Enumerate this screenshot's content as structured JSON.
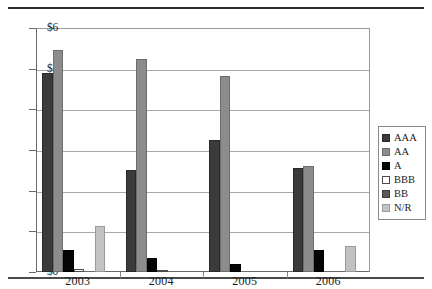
{
  "chart_data": {
    "type": "bar",
    "title": "",
    "xlabel": "",
    "ylabel": "",
    "categories": [
      "2003",
      "2004",
      "2005",
      "2006"
    ],
    "ylim": [
      0,
      6
    ],
    "ytick_labels": [
      "$0",
      "$1",
      "$2",
      "$3",
      "$4",
      "$5",
      "$6"
    ],
    "ytick_values": [
      0,
      1,
      2,
      3,
      4,
      5,
      6
    ],
    "grid": true,
    "legend_position": "right",
    "series": [
      {
        "name": "AAA",
        "color": "#3b3b3b",
        "values": [
          4.9,
          2.5,
          3.25,
          2.55
        ]
      },
      {
        "name": "AA",
        "color": "#8c8c8c",
        "values": [
          5.45,
          5.25,
          4.83,
          2.6
        ]
      },
      {
        "name": "A",
        "color": "#050505",
        "values": [
          0.55,
          0.35,
          0.2,
          0.53
        ]
      },
      {
        "name": "BBB",
        "color": "#ffffff",
        "values": [
          0.08,
          0.03,
          0.0,
          0.0
        ]
      },
      {
        "name": "BB",
        "color": "#5a5a5a",
        "values": [
          0.0,
          0.0,
          0.0,
          0.0
        ]
      },
      {
        "name": "N/R",
        "color": "#c2c2c2",
        "values": [
          1.12,
          0.0,
          0.0,
          0.65
        ]
      }
    ]
  },
  "legend": {
    "items": [
      {
        "label": "AAA",
        "swatch": "aaa"
      },
      {
        "label": "AA",
        "swatch": "aa"
      },
      {
        "label": "A",
        "swatch": "a"
      },
      {
        "label": "BBB",
        "swatch": "bbb"
      },
      {
        "label": "BB",
        "swatch": "bb"
      },
      {
        "label": "N/R",
        "swatch": "nr"
      }
    ]
  }
}
